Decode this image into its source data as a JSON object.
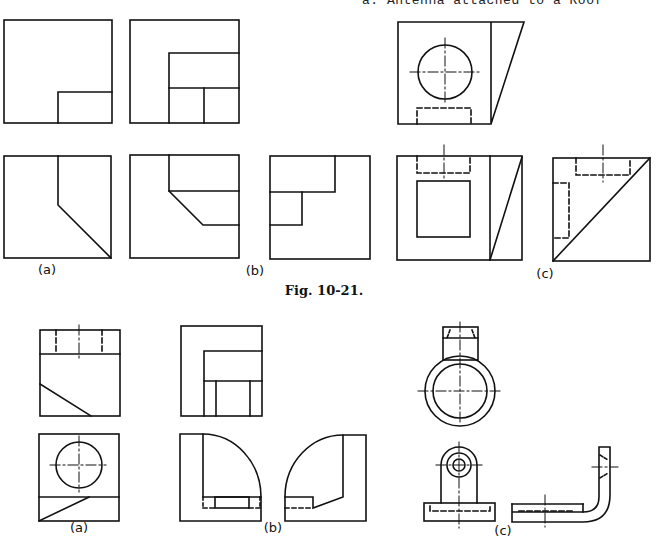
{
  "header": {
    "cut_text": "a. Antenna attached to a Roof"
  },
  "figure_10_21": {
    "caption": "Fig. 10-21.",
    "labels": [
      "(a)",
      "(b)",
      "(c)"
    ]
  },
  "figure_next": {
    "labels": [
      "(a)",
      "(b)",
      "(c)"
    ]
  }
}
